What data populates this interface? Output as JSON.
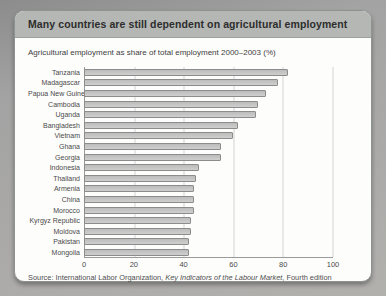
{
  "card": {
    "title": "Many countries are still dependent on agricultural employment",
    "subtitle": "Agricultural employment as share of total employment 2000–2003 (%)",
    "source_prefix": "Source: International Labor Organization, ",
    "source_italic": "Key Indicators of the Labour Market",
    "source_suffix": ", Fourth edition"
  },
  "colors": {
    "header_band": "#b4b7b4",
    "bar_fill": "#c6c6c6",
    "bar_border": "#8c8c8c",
    "gridline": "#d4d4d4",
    "axis": "#9a9a9a"
  },
  "chart_data": {
    "type": "bar",
    "orientation": "horizontal",
    "title": "Many countries are still dependent on agricultural employment",
    "subtitle": "Agricultural employment as share of total employment 2000–2003 (%)",
    "categories": [
      "Tanzania",
      "Madagascar",
      "Papua New Guinea",
      "Cambodia",
      "Uganda",
      "Bangladesh",
      "Vietnam",
      "Ghana",
      "Georgia",
      "Indonesia",
      "Thailand",
      "Armenia",
      "China",
      "Morocco",
      "Kyrgyz Republic",
      "Moldova",
      "Pakistan",
      "Mongolia"
    ],
    "values": [
      82,
      78,
      73,
      70,
      69,
      62,
      60,
      55,
      55,
      46,
      45,
      44,
      44,
      44,
      43,
      43,
      42,
      42
    ],
    "xlabel": "",
    "ylabel": "",
    "xlim": [
      0,
      100
    ],
    "xticks": [
      0,
      20,
      40,
      60,
      80,
      100
    ],
    "grid": true,
    "legend": false,
    "source": "Source: International Labor Organization, Key Indicators of the Labour Market, Fourth edition"
  }
}
